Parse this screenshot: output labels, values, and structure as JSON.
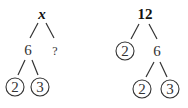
{
  "trees": [
    {
      "root": "x",
      "root_style": "bold-italic",
      "children": [
        {
          "label": "6",
          "circled": false,
          "children": [
            {
              "label": "2",
              "circled": true
            },
            {
              "label": "3",
              "circled": true
            }
          ]
        },
        {
          "label": "?",
          "circled": false
        }
      ]
    },
    {
      "root": "12",
      "root_style": "bold",
      "children": [
        {
          "label": "2",
          "circled": true
        },
        {
          "label": "6",
          "circled": false,
          "children": [
            {
              "label": "2",
              "circled": true
            },
            {
              "label": "3",
              "circled": true
            }
          ]
        }
      ]
    }
  ]
}
